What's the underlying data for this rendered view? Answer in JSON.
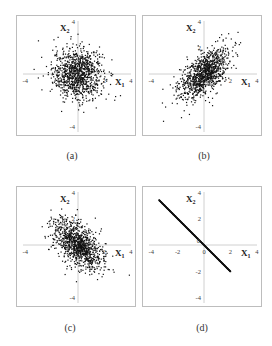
{
  "figure": {
    "captions": [
      "(a)",
      "(b)",
      "(c)",
      "(d)"
    ],
    "axis_label_x": "X",
    "axis_label_x_sub": "1",
    "axis_label_y": "X",
    "axis_label_y_sub": "2"
  },
  "colors": {
    "points": "#111111",
    "axis": "#d0d0d0",
    "frame": "#bdbdbd",
    "tick_text": "#444444"
  },
  "chart_data": [
    {
      "type": "scatter",
      "title": "(a)",
      "xlabel": "X1",
      "ylabel": "X2",
      "xlim": [
        -4,
        4
      ],
      "ylim": [
        -4,
        4
      ],
      "x_ticks": [
        "-4",
        "2",
        "4"
      ],
      "y_ticks": [
        "4",
        "-4"
      ],
      "grid": false,
      "distribution": {
        "mean": [
          0,
          0
        ],
        "std": [
          1,
          1
        ],
        "correlation": 0.0,
        "n": 1000
      },
      "description": "Uncorrelated bivariate normal cloud centered at origin"
    },
    {
      "type": "scatter",
      "title": "(b)",
      "xlabel": "X1",
      "ylabel": "X2",
      "xlim": [
        -4,
        4
      ],
      "ylim": [
        -4,
        4
      ],
      "x_ticks": [
        "-4",
        "2",
        "4"
      ],
      "y_ticks": [
        "4",
        "2",
        "-4"
      ],
      "grid": false,
      "distribution": {
        "mean": [
          0,
          0
        ],
        "std": [
          1,
          1
        ],
        "correlation": 0.6,
        "n": 1000
      },
      "description": "Positively correlated bivariate normal cloud"
    },
    {
      "type": "scatter",
      "title": "(c)",
      "xlabel": "X1",
      "ylabel": "X2",
      "xlim": [
        -4,
        4
      ],
      "ylim": [
        -4,
        4
      ],
      "x_ticks": [
        "-4",
        "2",
        "4"
      ],
      "y_ticks": [
        "4",
        "2",
        "-4"
      ],
      "grid": false,
      "distribution": {
        "mean": [
          0,
          0
        ],
        "std": [
          1,
          1
        ],
        "correlation": -0.5,
        "n": 1000
      },
      "description": "Negatively correlated bivariate normal cloud"
    },
    {
      "type": "scatter",
      "title": "(d)",
      "xlabel": "X1",
      "ylabel": "X2",
      "xlim": [
        -4,
        4
      ],
      "ylim": [
        -4,
        4
      ],
      "x_ticks": [
        "-4",
        "-2",
        "0",
        "2",
        "4"
      ],
      "y_ticks": [
        "4",
        "2",
        "0",
        "-2",
        "-4"
      ],
      "grid": false,
      "distribution": {
        "mean": [
          0,
          0
        ],
        "std": [
          1,
          1
        ],
        "correlation": -1.0,
        "n": 1000
      },
      "line": {
        "x_start": -3.4,
        "y_start": 3.4,
        "x_end": 2.0,
        "y_end": -2.0
      },
      "description": "Perfectly negatively correlated points forming line X2 = -X1"
    }
  ]
}
